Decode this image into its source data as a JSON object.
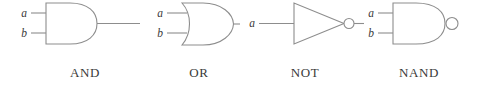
{
  "figure": {
    "background_color": "#ffffff",
    "line_color": "#8d8d8d",
    "text_color": "#3a3a3a",
    "width": 481,
    "height": 89
  },
  "gates": [
    {
      "id": "and",
      "caption": "AND",
      "symbol_shape": "d-shape-flat-left-round-right",
      "inverted_output": false,
      "inputs": [
        {
          "label": "a"
        },
        {
          "label": "b"
        }
      ],
      "output": {
        "label": ""
      }
    },
    {
      "id": "or",
      "caption": "OR",
      "symbol_shape": "curved-back-pointed-nose",
      "inverted_output": false,
      "inputs": [
        {
          "label": "a"
        },
        {
          "label": "b"
        }
      ],
      "output": {
        "label": ""
      }
    },
    {
      "id": "not",
      "caption": "NOT",
      "symbol_shape": "triangle-with-bubble",
      "inverted_output": true,
      "inputs": [
        {
          "label": "a"
        }
      ],
      "output": {
        "label": ""
      }
    },
    {
      "id": "nand",
      "caption": "NAND",
      "symbol_shape": "d-shape-with-bubble",
      "inverted_output": true,
      "inputs": [
        {
          "label": "a"
        },
        {
          "label": "b"
        }
      ],
      "output": {
        "label": ""
      }
    }
  ]
}
